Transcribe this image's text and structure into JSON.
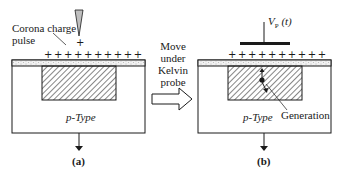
{
  "panel_a": {
    "corona_label_line1": "Corona  charge",
    "corona_label_line2": "pulse",
    "needle_plus": "+",
    "surface_charges": "++++++++++",
    "substrate_label": "p-Type",
    "caption": "(a)"
  },
  "transition": {
    "line1": "Move",
    "line2": "under",
    "line3": "Kelvin",
    "line4": "probe"
  },
  "panel_b": {
    "probe_voltage_label": "V",
    "probe_voltage_sub": "P",
    "probe_voltage_arg": " (t)",
    "surface_charges": "++++++++++",
    "substrate_label": "p-Type",
    "generation_label": "Generation",
    "caption": "(b)"
  },
  "colors": {
    "line": "#1a1a1a",
    "oxide_fill": "#f2f2f2",
    "hatch": "#333333",
    "needle_fill": "#bfbfbf"
  }
}
